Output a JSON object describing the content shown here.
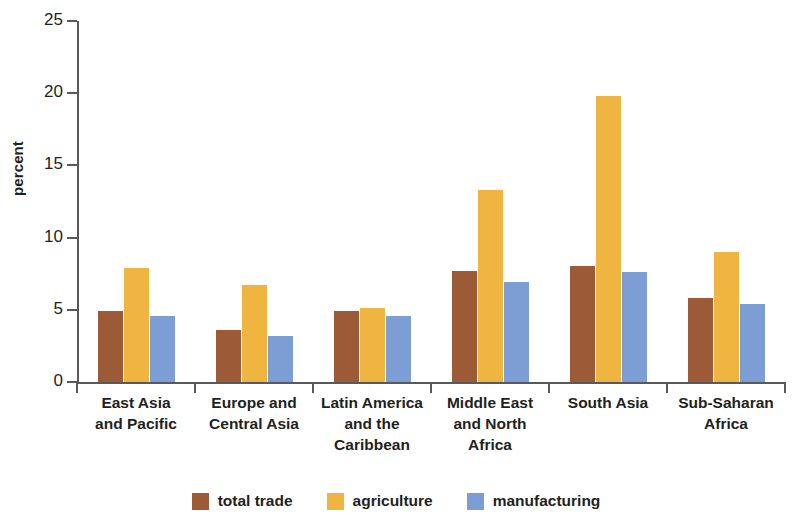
{
  "chart_data": {
    "type": "bar",
    "title": "",
    "subtitle": "",
    "xlabel": "",
    "ylabel": "percent",
    "ylim": [
      0,
      25
    ],
    "yticks": [
      0,
      5,
      10,
      15,
      20,
      25
    ],
    "ytick_labels": [
      "0",
      "5",
      "10",
      "15",
      "20",
      "25"
    ],
    "grid": false,
    "legend_position": "bottom",
    "categories": [
      "East Asia\nand Pacific",
      "Europe and\nCentral Asia",
      "Latin America\nand the\nCaribbean",
      "Middle East\nand North\nAfrica",
      "South Asia",
      "Sub-Saharan\nAfrica"
    ],
    "category_lines": [
      [
        "East Asia",
        "and Pacific"
      ],
      [
        "Europe and",
        "Central Asia"
      ],
      [
        "Latin America",
        "and the",
        "Caribbean"
      ],
      [
        "Middle East",
        "and North",
        "Africa"
      ],
      [
        "South Asia"
      ],
      [
        "Sub-Saharan",
        "Africa"
      ]
    ],
    "series": [
      {
        "name": "total trade",
        "key": "total_trade",
        "color": "#9c5a36",
        "values": [
          4.9,
          3.6,
          4.9,
          7.7,
          8.0,
          5.8
        ]
      },
      {
        "name": "agriculture",
        "key": "agriculture",
        "color": "#f0b441",
        "values": [
          7.9,
          6.7,
          5.1,
          13.3,
          19.8,
          9.0
        ]
      },
      {
        "name": "manufacturing",
        "key": "manufacturing",
        "color": "#7d9ed4",
        "values": [
          4.6,
          3.2,
          4.6,
          6.9,
          7.6,
          5.4
        ]
      }
    ]
  },
  "legend": {
    "items": [
      {
        "label": "total trade",
        "color": "#9c5a36"
      },
      {
        "label": "agriculture",
        "color": "#f0b441"
      },
      {
        "label": "manufacturing",
        "color": "#7d9ed4"
      }
    ]
  },
  "axis": {
    "y_title": "percent"
  }
}
